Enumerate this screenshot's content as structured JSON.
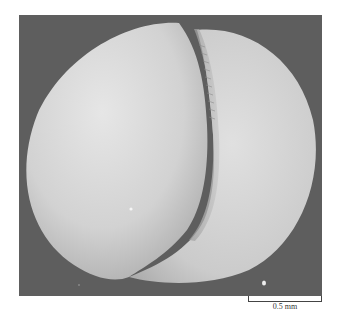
{
  "figure": {
    "background_color": "#5e5e5e",
    "specimen_color": "#d4d4d4"
  },
  "scale_bar": {
    "label": "0.5 mm"
  }
}
